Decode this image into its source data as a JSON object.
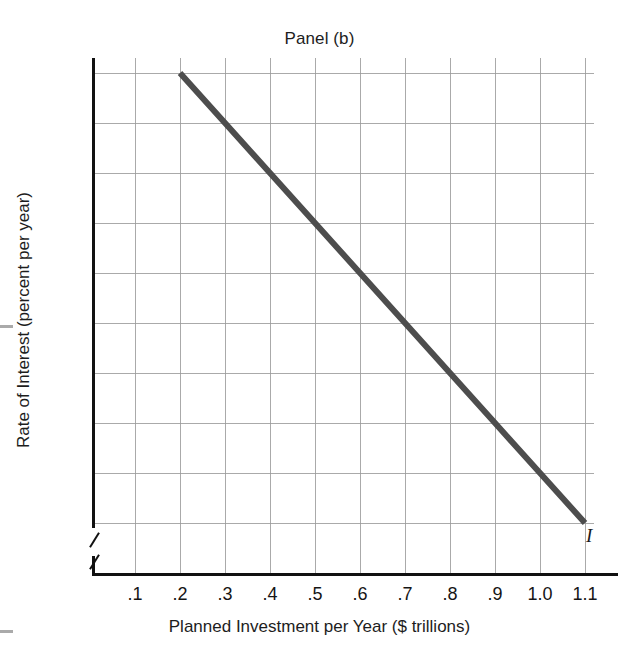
{
  "chart_data": {
    "type": "line",
    "title": "Panel (b)",
    "xlabel": "Planned Investment per Year ($ trillions)",
    "ylabel": "Rate of Interest (percent per year)",
    "xlim": [
      0,
      1.2
    ],
    "ylim": [
      5.5,
      15.5
    ],
    "grid": true,
    "legend": "none",
    "x_tick_labels": [
      "0",
      ".1",
      ".2",
      ".3",
      ".4",
      ".5",
      ".6",
      ".7",
      ".8",
      ".9",
      "1.0",
      "1.1"
    ],
    "x_tick_values": [
      0,
      0.1,
      0.2,
      0.3,
      0.4,
      0.5,
      0.6,
      0.7,
      0.8,
      0.9,
      1.0,
      1.1
    ],
    "y_tick_labels": [
      "6",
      "7",
      "8",
      "9",
      "10",
      "11",
      "12",
      "13",
      "14",
      "15"
    ],
    "y_tick_values": [
      6,
      7,
      8,
      9,
      10,
      11,
      12,
      13,
      14,
      15
    ],
    "y_axis_break": true,
    "y_origin_label": "0",
    "series": [
      {
        "name": "I",
        "annotation": "I",
        "color": "#4d4d4d",
        "line_width": 6,
        "x": [
          0.2,
          0.3,
          0.4,
          0.5,
          0.6,
          0.7,
          0.8,
          0.9,
          1.0,
          1.1
        ],
        "y": [
          15,
          14,
          13,
          12,
          11,
          10,
          9,
          8,
          7,
          6
        ]
      }
    ]
  },
  "colors": {
    "curve": "#4d4d4d",
    "axis": "#111111",
    "gridline": "#9b9b9b",
    "background": "#ffffff",
    "text": "#1a1a1a"
  }
}
